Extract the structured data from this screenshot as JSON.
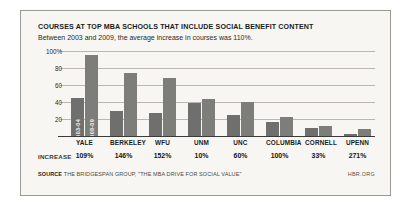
{
  "figure": {
    "title": "COURSES AT TOP MBA SCHOOLS THAT INCLUDE SOCIAL BENEFIT CONTENT",
    "subtitle": "Between 2003 and 2009, the average increase in courses was 110%.",
    "increase_row_label": "INCREASE",
    "source_prefix": "SOURCE",
    "source_text": "THE BRIDGESPAN GROUP, \"THE MBA DRIVE FOR SOCIAL VALUE\"",
    "brand": "HBR.ORG"
  },
  "colors": {
    "series_2003": "#6f6f6d",
    "series_2008": "#7d7d7a",
    "gridline": "#b9b7b0",
    "baseline": "#3a3a38",
    "panel_background": "#f7f6f2",
    "panel_border": "#9a9a94",
    "text": "#1b1b1b"
  },
  "chart_data": {
    "type": "bar",
    "title": "COURSES AT TOP MBA SCHOOLS THAT INCLUDE SOCIAL BENEFIT CONTENT",
    "subtitle": "Between 2003 and 2009, the average increase in courses was 110%.",
    "xlabel": "",
    "ylabel": "",
    "ylim": [
      0,
      100
    ],
    "yticks": [
      20,
      40,
      60,
      80,
      100
    ],
    "ytick_labels": [
      "20",
      "40",
      "60",
      "80",
      "100%"
    ],
    "grid": true,
    "legend_position": "in-bar (first group)",
    "categories": [
      "YALE",
      "BERKELEY",
      "WFU",
      "UNM",
      "UNC",
      "COLUMBIA",
      "CORNELL",
      "UPENN"
    ],
    "series": [
      {
        "name": "2003-04",
        "values": [
          45,
          30,
          27,
          39,
          25,
          16,
          9,
          2
        ]
      },
      {
        "name": "2008-09",
        "values": [
          95,
          74,
          68,
          43,
          40,
          22,
          12,
          8
        ]
      }
    ],
    "annotations": {
      "increase_label": "INCREASE",
      "increase_values": [
        "109%",
        "146%",
        "152%",
        "10%",
        "60%",
        "100%",
        "33%",
        "271%"
      ]
    }
  }
}
